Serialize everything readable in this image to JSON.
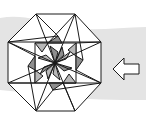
{
  "figure": {
    "type": "geometric-diagram",
    "colors": {
      "background": "#ffffff",
      "band": "#e4e4e4",
      "line": "#1a1a1a",
      "shade_dark": "#8e8e8e",
      "shade_light": "#b8b8b8",
      "fill": "#ffffff"
    },
    "icons": [
      "octagon-figure",
      "arrow-left-icon"
    ]
  }
}
